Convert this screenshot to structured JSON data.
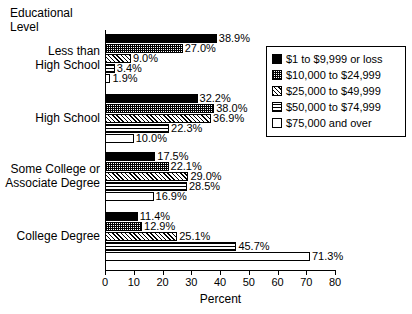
{
  "chart_data": {
    "type": "bar",
    "orientation": "horizontal",
    "title": "",
    "xlabel": "Percent",
    "ylabel": "Educational Level",
    "xlim": [
      0,
      80
    ],
    "xticks": [
      0,
      10,
      20,
      30,
      40,
      50,
      60,
      70,
      80
    ],
    "grid": false,
    "legend_position": "top-right",
    "categories": [
      "Less than High School",
      "High School",
      "Some College or Associate Degree",
      "College Degree"
    ],
    "category_label_lines": [
      [
        "Less than",
        "High School"
      ],
      [
        "High School"
      ],
      [
        "Some College or",
        "Associate Degree"
      ],
      [
        "College Degree"
      ]
    ],
    "series": [
      {
        "name": "$1 to $9,999 or loss",
        "pattern": "solid",
        "values": [
          38.9,
          32.2,
          17.5,
          11.4
        ],
        "labels": [
          "38.9%",
          "32.2%",
          "17.5%",
          "11.4%"
        ]
      },
      {
        "name": "$10,000 to $24,999",
        "pattern": "check",
        "values": [
          27.0,
          38.0,
          22.1,
          12.9
        ],
        "labels": [
          "27.0%",
          "38.0%",
          "22.1%",
          "12.9%"
        ]
      },
      {
        "name": "$25,000 to $49,999",
        "pattern": "diag",
        "values": [
          9.0,
          36.9,
          29.0,
          25.1
        ],
        "labels": [
          "9.0%",
          "36.9%",
          "29.0%",
          "25.1%"
        ]
      },
      {
        "name": "$50,000 to $74,999",
        "pattern": "hlines",
        "values": [
          3.4,
          22.3,
          28.5,
          45.7
        ],
        "labels": [
          "3.4%",
          "22.3%",
          "28.5%",
          "45.7%"
        ]
      },
      {
        "name": "$75,000 and over",
        "pattern": "empty",
        "values": [
          1.9,
          10.0,
          16.9,
          71.3
        ],
        "labels": [
          "1.9%",
          "10.0%",
          "16.9%",
          "71.3%"
        ]
      }
    ]
  },
  "axis": {
    "y_title_lines": [
      "Educational",
      "Level"
    ],
    "x_title": "Percent",
    "tick_labels": [
      "0",
      "10",
      "20",
      "30",
      "40",
      "50",
      "60",
      "70",
      "80"
    ]
  },
  "legend": {
    "entries": [
      {
        "label": "$1 to $9,999 or loss",
        "pattern": "solid"
      },
      {
        "label": "$10,000 to $24,999",
        "pattern": "check"
      },
      {
        "label": "$25,000 to $49,999",
        "pattern": "diag"
      },
      {
        "label": "$50,000 to $74,999",
        "pattern": "hlines"
      },
      {
        "label": "$75,000 and over",
        "pattern": "empty"
      }
    ]
  },
  "colors": {
    "ink": "#000000",
    "paper": "#ffffff"
  }
}
